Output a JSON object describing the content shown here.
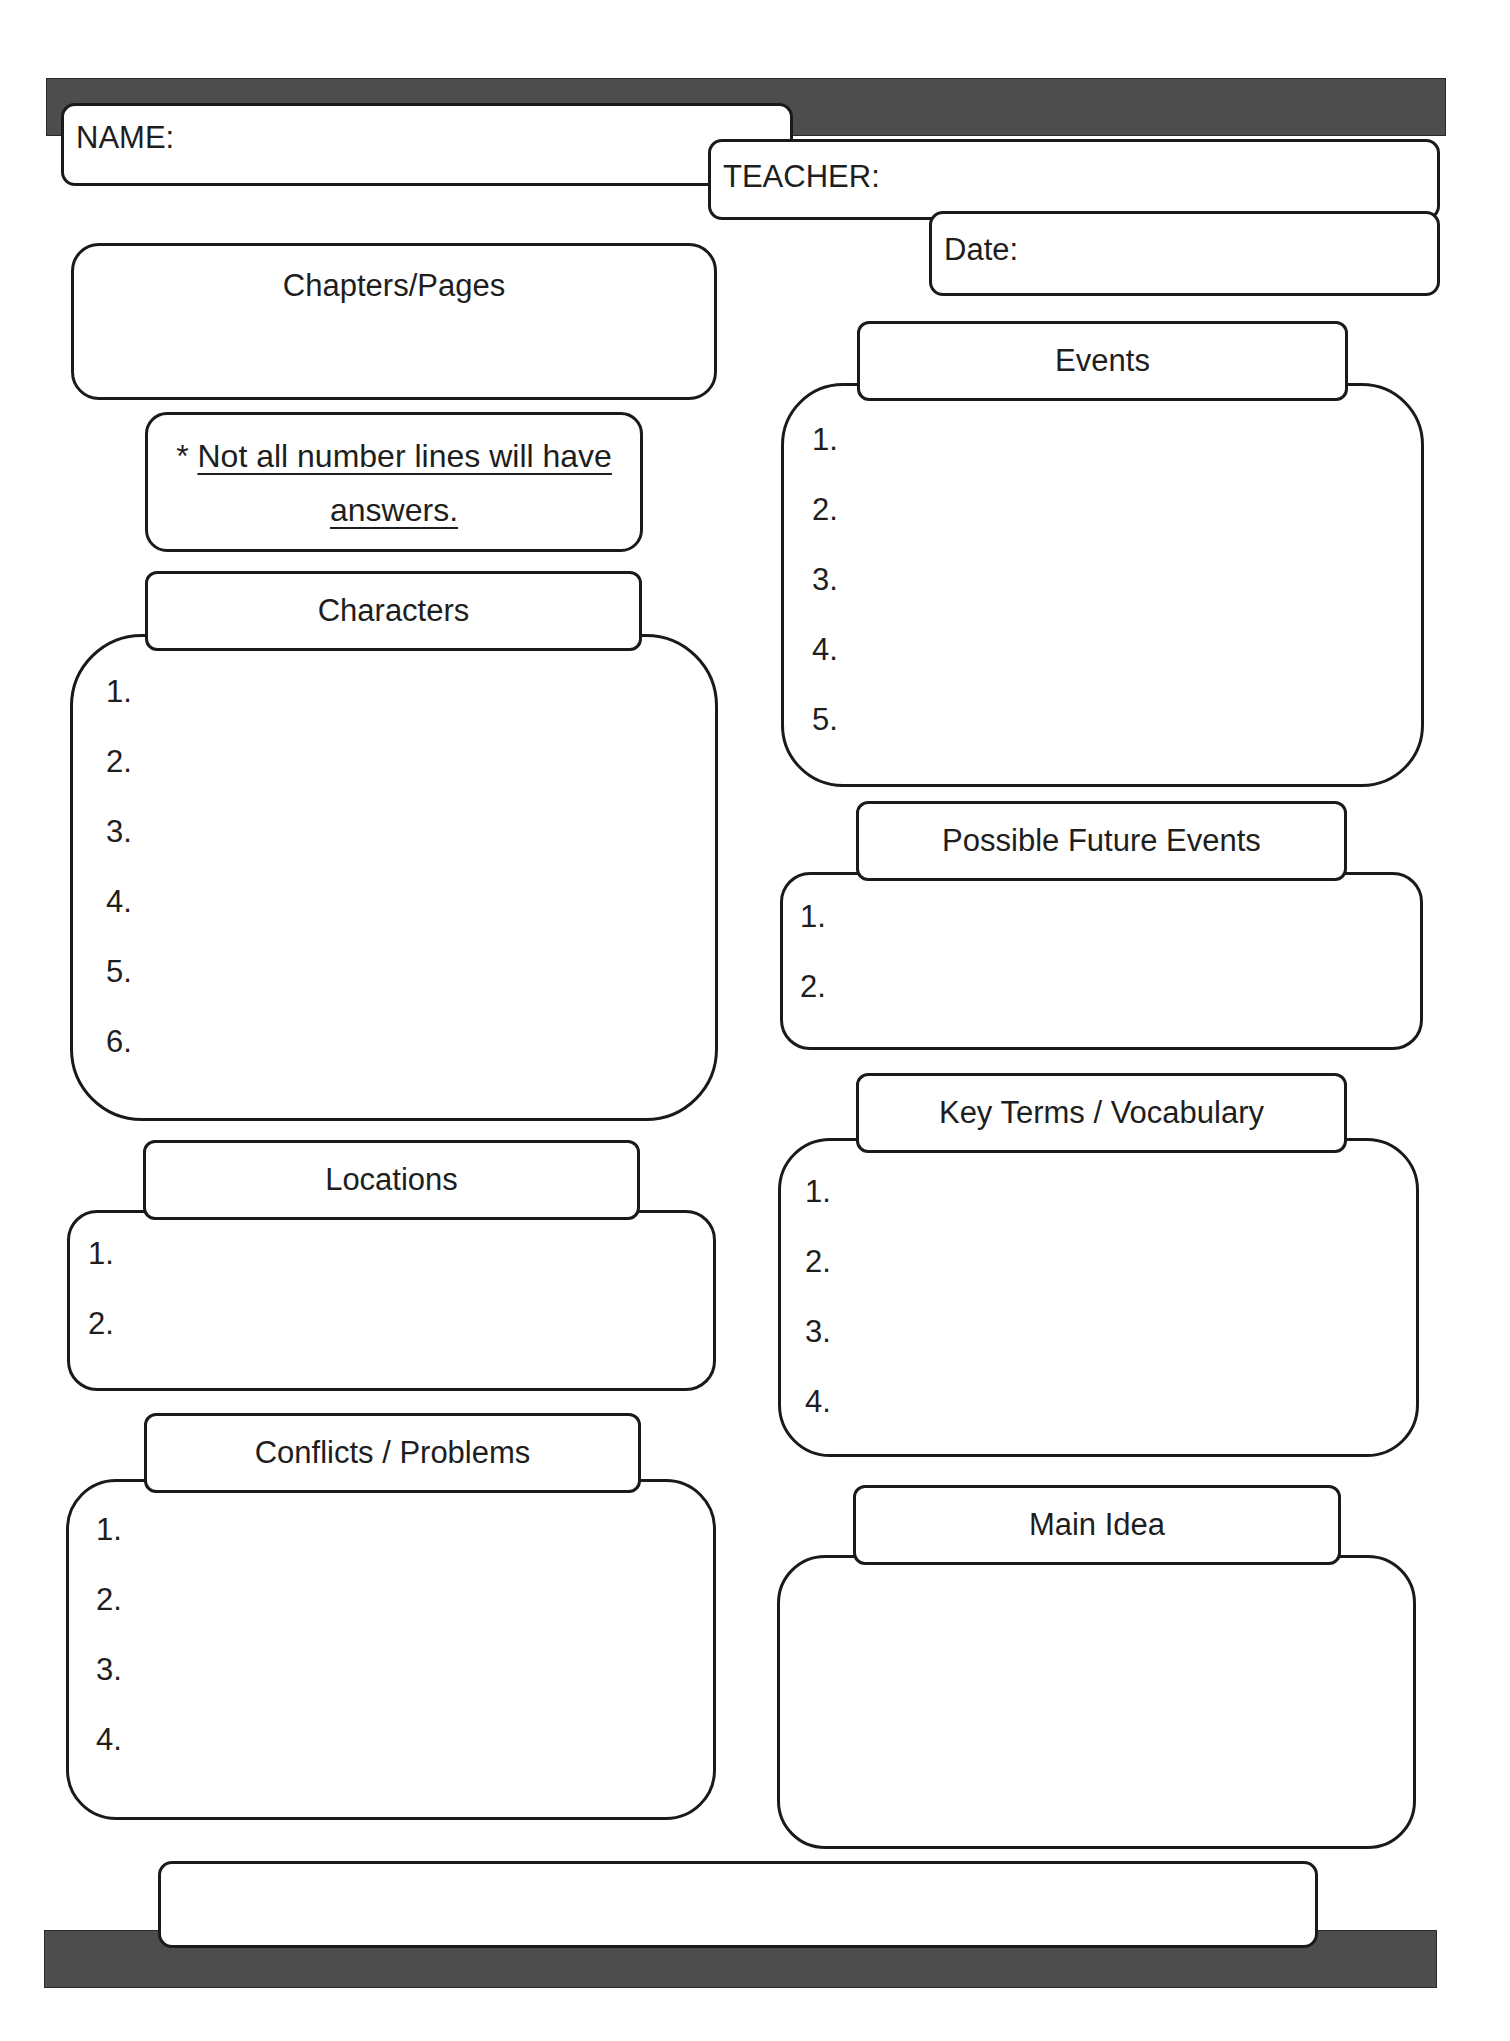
{
  "header": {
    "name_label": "NAME:",
    "teacher_label": "TEACHER:",
    "date_label": "Date:"
  },
  "chapters_pages": {
    "title": "Chapters/Pages"
  },
  "note": {
    "asterisk": "*",
    "line1": "Not all number lines will have",
    "line2": "answers."
  },
  "sections": {
    "characters": {
      "title": "Characters",
      "items": [
        "1.",
        "2.",
        "3.",
        "4.",
        "5.",
        "6."
      ]
    },
    "locations": {
      "title": "Locations",
      "items": [
        "1.",
        "2."
      ]
    },
    "conflicts": {
      "title": "Conflicts / Problems",
      "items": [
        "1.",
        "2.",
        "3.",
        "4."
      ]
    },
    "events": {
      "title": "Events",
      "items": [
        "1.",
        "2.",
        "3.",
        "4.",
        "5."
      ]
    },
    "future_events": {
      "title": "Possible Future Events",
      "items": [
        "1.",
        "2."
      ]
    },
    "key_terms": {
      "title": "Key Terms / Vocabulary",
      "items": [
        "1.",
        "2.",
        "3.",
        "4."
      ]
    },
    "main_idea": {
      "title": "Main Idea"
    }
  },
  "footer": {
    "box_text": ""
  },
  "colors": {
    "bar": "#4d4d4d",
    "border": "#1a1a1a",
    "text": "#1e1e1e"
  }
}
